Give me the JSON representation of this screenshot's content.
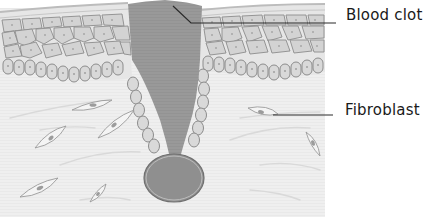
{
  "diagram": {
    "type": "biological-illustration",
    "labels": [
      {
        "id": "blood-clot",
        "text": "Blood clot"
      },
      {
        "id": "fibroblast",
        "text": "Fibroblast"
      }
    ],
    "colors": {
      "background": "#ffffff",
      "dermis": "#efefef",
      "epidermis_surface": "#e2e2e2",
      "epidermis_cell": "#d4d4d4",
      "cell_border": "#8c8c8c",
      "clot": "#9a9a9a",
      "clot_bulb": "#8f8f8f",
      "leader_line": "#2a2a2a",
      "fibroblast_fill": "#f4f4f4",
      "fibroblast_nucleus": "#9c9c9c"
    }
  }
}
